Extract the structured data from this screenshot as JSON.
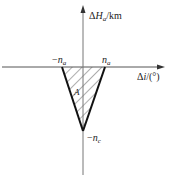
{
  "diagram": {
    "y_axis_label": {
      "delta": "Δ",
      "var": "H",
      "sub": "a",
      "unit": "/km"
    },
    "x_axis_label": {
      "delta": "Δ",
      "var": "i",
      "unit": "/(°)"
    },
    "neg_na": {
      "sign": "−",
      "var": "n",
      "sub": "a"
    },
    "pos_na": {
      "var": "n",
      "sub": "a"
    },
    "neg_nc": {
      "sign": "−",
      "var": "n",
      "sub": "c"
    },
    "region_label": "A",
    "colors": {
      "axis": "#555555",
      "triangle": "#111111",
      "hatch": "#333333"
    }
  }
}
